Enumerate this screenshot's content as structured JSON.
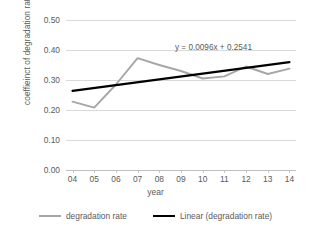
{
  "chart_data": {
    "type": "line",
    "title": "",
    "xlabel": "year",
    "ylabel": "coeffieinct of degradation rate",
    "categories": [
      "04",
      "05",
      "06",
      "07",
      "08",
      "09",
      "10",
      "11",
      "12",
      "13",
      "14"
    ],
    "series": [
      {
        "name": "degradation rate",
        "type": "line",
        "color": "#a6a6a6",
        "values": [
          0.228,
          0.208,
          0.285,
          0.373,
          0.35,
          0.33,
          0.305,
          0.312,
          0.345,
          0.32,
          0.338
        ]
      },
      {
        "name": "Linear (degradation rate)",
        "type": "trendline",
        "color": "#000000",
        "equation": "y = 0.0096x + 0.2541",
        "slope": 0.0096,
        "intercept": 0.2541,
        "values": [
          0.2637,
          0.2733,
          0.2829,
          0.2925,
          0.3021,
          0.3117,
          0.3213,
          0.3309,
          0.3405,
          0.3501,
          0.3597
        ]
      }
    ],
    "ylim": [
      0.0,
      0.5
    ],
    "ytick_values": [
      0.0,
      0.1,
      0.2,
      0.3,
      0.4,
      0.5
    ],
    "ytick_labels": [
      "0.00",
      "0.10",
      "0.20",
      "0.30",
      "0.40",
      "0.50"
    ],
    "grid": true,
    "legend_position": "bottom",
    "annotations": [
      {
        "text": "y = 0.0096x + 0.2541",
        "anchor": "trendline-equation"
      }
    ]
  },
  "axes": {
    "y_title": "coeffieinct of degradation rate",
    "x_title": "year"
  },
  "legend": {
    "items": [
      {
        "label": "degradation rate",
        "color": "#a6a6a6"
      },
      {
        "label": "Linear (degradation rate)",
        "color": "#000000"
      }
    ]
  },
  "equation_label": "y = 0.0096x + 0.2541",
  "colors": {
    "series": "#a6a6a6",
    "trend": "#000000",
    "gridline": "#d9d9d9",
    "text": "#5a5a5a",
    "background": "#ffffff"
  }
}
